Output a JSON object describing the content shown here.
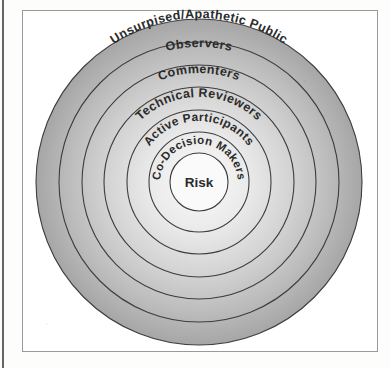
{
  "figure": {
    "type": "concentric-circles-diagram",
    "center_label": "Risk",
    "rings": [
      {
        "label": "Unsurpised/Apathetic Public",
        "level": 6
      },
      {
        "label": "Observers",
        "level": 5
      },
      {
        "label": "Commenters",
        "level": 4
      },
      {
        "label": "Technical Reviewers",
        "level": 3
      },
      {
        "label": "Active Participants",
        "level": 2
      },
      {
        "label": "Co-Decision Makers",
        "level": 1
      }
    ],
    "colors": {
      "ring_outer_fill": "#a9a9a9",
      "ring_inner_fill": "#f2f2f2",
      "ring_stroke": "#3d3d3d",
      "center_fill": "#fafafa",
      "label_text": "#2b2b2b",
      "frame_border": "#9a9a9a",
      "page_background": "#fdfdfc"
    },
    "geometry": {
      "center_x": 199,
      "center_y": 182,
      "radii": [
        163,
        140,
        117,
        95,
        72,
        50,
        29
      ]
    }
  }
}
